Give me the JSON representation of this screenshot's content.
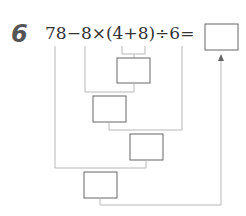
{
  "problem": {
    "number": "6",
    "expression": "78−8×(4+8)÷6=",
    "answer_box": ""
  },
  "steps": [
    {
      "label": "step-1-box",
      "value": ""
    },
    {
      "label": "step-2-box",
      "value": ""
    },
    {
      "label": "step-3-box",
      "value": ""
    },
    {
      "label": "step-4-box",
      "value": ""
    }
  ]
}
